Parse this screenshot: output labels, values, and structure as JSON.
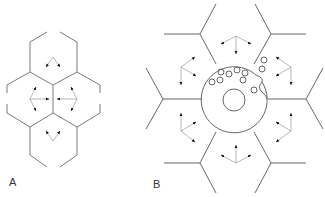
{
  "figure": {
    "panels": [
      {
        "id": "A",
        "label": "A",
        "description": "Four hexagonal cells in a cluster with arrows indicating outward/inward movement toward shared boundaries"
      },
      {
        "id": "B",
        "label": "B",
        "description": "Central circular cell with nucleus and small vesicles surrounded by six polygonal cells with three-arrow clusters"
      }
    ]
  },
  "labels": {
    "a": "A",
    "b": "B"
  },
  "colors": {
    "line": "#7a7a7a",
    "arrow": "#222222",
    "background": "#ffffff"
  }
}
